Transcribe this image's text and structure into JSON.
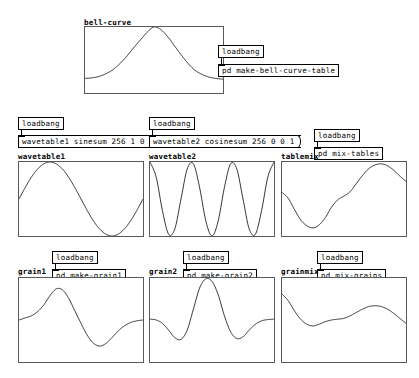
{
  "window": {
    "title": "pd patch",
    "background": "#ffffff",
    "foreground": "#000000",
    "array_border_color": "#555a5e"
  },
  "sections": [
    {
      "id": "bell-curve",
      "array_label": "bell-curve",
      "loadbang_label": "loadbang",
      "subpatch_label": "pd make-bell-curve-table"
    },
    {
      "id": "wavetable1",
      "array_label": "wavetable1",
      "loadbang_label": "loadbang",
      "message_label": "wavetable1 sinesum 256 1 0"
    },
    {
      "id": "wavetable2",
      "array_label": "wavetable2",
      "loadbang_label": "loadbang",
      "message_label": "wavetable2 cosinesum 256 0 0 1"
    },
    {
      "id": "tablemix",
      "array_label": "tablemix",
      "loadbang_label": "loadbang",
      "subpatch_label": "pd mix-tables"
    },
    {
      "id": "grain1",
      "array_label": "grain1",
      "loadbang_label": "loadbang",
      "subpatch_label": "pd make-grain1"
    },
    {
      "id": "grain2",
      "array_label": "grain2",
      "loadbang_label": "loadbang",
      "subpatch_label": "pd make-grain2"
    },
    {
      "id": "grainmix",
      "array_label": "grainmix",
      "loadbang_label": "loadbang",
      "subpatch_label": "pd mix-grains"
    }
  ],
  "chart_data": [
    {
      "id": "bell-curve",
      "type": "line",
      "title": "bell-curve",
      "xlabel": "",
      "ylabel": "",
      "xlim": [
        0,
        1
      ],
      "ylim": [
        0,
        1
      ],
      "grid": false,
      "description": "gaussian bell curve, baseline near 0.22, peak 1.0 centered",
      "x": [
        0.0,
        0.05,
        0.1,
        0.15,
        0.2,
        0.25,
        0.3,
        0.35,
        0.4,
        0.45,
        0.5,
        0.55,
        0.6,
        0.65,
        0.7,
        0.75,
        0.8,
        0.85,
        0.9,
        0.95,
        1.0
      ],
      "y": [
        0.22,
        0.23,
        0.25,
        0.29,
        0.35,
        0.44,
        0.55,
        0.68,
        0.8,
        0.92,
        1.0,
        0.96,
        0.85,
        0.71,
        0.57,
        0.44,
        0.34,
        0.28,
        0.24,
        0.22,
        0.21
      ]
    },
    {
      "id": "wavetable1",
      "type": "line",
      "title": "wavetable1",
      "xlabel": "",
      "ylabel": "",
      "xlim": [
        0,
        1
      ],
      "ylim": [
        -1,
        1
      ],
      "grid": false,
      "description": "one cycle sine, sinesum 256 1 0",
      "x": [
        0.0,
        0.05,
        0.1,
        0.15,
        0.2,
        0.25,
        0.3,
        0.35,
        0.4,
        0.45,
        0.5,
        0.55,
        0.6,
        0.65,
        0.7,
        0.75,
        0.8,
        0.85,
        0.9,
        0.95,
        1.0
      ],
      "y": [
        0.0,
        0.31,
        0.59,
        0.81,
        0.95,
        1.0,
        0.95,
        0.81,
        0.59,
        0.31,
        0.0,
        -0.31,
        -0.59,
        -0.81,
        -0.95,
        -1.0,
        -0.95,
        -0.81,
        -0.59,
        -0.31,
        0.0
      ]
    },
    {
      "id": "wavetable2",
      "type": "line",
      "title": "wavetable2",
      "xlabel": "",
      "ylabel": "",
      "xlim": [
        0,
        1
      ],
      "ylim": [
        -1,
        1
      ],
      "grid": false,
      "description": "third harmonic cosine, cosinesum 256 0 0 1",
      "x": [
        0.0,
        0.05,
        0.1,
        0.15,
        0.2,
        0.25,
        0.3,
        0.35,
        0.4,
        0.45,
        0.5,
        0.55,
        0.6,
        0.65,
        0.7,
        0.75,
        0.8,
        0.85,
        0.9,
        0.95,
        1.0
      ],
      "y": [
        1.0,
        0.59,
        -0.31,
        -0.95,
        -0.81,
        0.0,
        0.81,
        0.95,
        0.31,
        -0.59,
        -1.0,
        -0.59,
        0.31,
        0.95,
        0.81,
        0.0,
        -0.81,
        -0.95,
        -0.31,
        0.59,
        1.0
      ]
    },
    {
      "id": "tablemix",
      "type": "line",
      "title": "tablemix",
      "xlabel": "",
      "ylabel": "",
      "xlim": [
        0,
        1
      ],
      "ylim": [
        -1,
        1
      ],
      "grid": false,
      "description": "sum of wavetable1 and wavetable2 contents",
      "x": [
        0.0,
        0.05,
        0.1,
        0.15,
        0.2,
        0.25,
        0.3,
        0.35,
        0.4,
        0.45,
        0.5,
        0.55,
        0.6,
        0.65,
        0.7,
        0.75,
        0.8,
        0.85,
        0.9,
        0.95,
        1.0
      ],
      "y": [
        0.18,
        0.02,
        -0.28,
        -0.56,
        -0.72,
        -0.78,
        -0.7,
        -0.5,
        -0.22,
        -0.02,
        0.08,
        0.2,
        0.42,
        0.64,
        0.82,
        0.92,
        0.95,
        0.9,
        0.78,
        0.62,
        0.48
      ]
    },
    {
      "id": "grain1",
      "type": "line",
      "title": "grain1",
      "xlabel": "",
      "ylabel": "",
      "xlim": [
        0,
        1
      ],
      "ylim": [
        -1,
        1
      ],
      "grid": false,
      "description": "wavetable1 sine windowed by the bell curve",
      "x": [
        0.0,
        0.05,
        0.1,
        0.15,
        0.2,
        0.25,
        0.3,
        0.35,
        0.4,
        0.45,
        0.5,
        0.55,
        0.6,
        0.65,
        0.7,
        0.75,
        0.8,
        0.85,
        0.9,
        0.95,
        1.0
      ],
      "y": [
        0.0,
        0.05,
        0.1,
        0.2,
        0.36,
        0.58,
        0.74,
        0.72,
        0.52,
        0.22,
        -0.08,
        -0.36,
        -0.55,
        -0.62,
        -0.56,
        -0.42,
        -0.26,
        -0.14,
        -0.06,
        -0.02,
        0.0
      ]
    },
    {
      "id": "grain2",
      "type": "line",
      "title": "grain2",
      "xlabel": "",
      "ylabel": "",
      "xlim": [
        0,
        1
      ],
      "ylim": [
        -1,
        1
      ],
      "grid": false,
      "description": "wavetable2 cosine windowed by the bell curve",
      "x": [
        0.0,
        0.05,
        0.1,
        0.15,
        0.2,
        0.25,
        0.3,
        0.35,
        0.4,
        0.45,
        0.5,
        0.55,
        0.6,
        0.65,
        0.7,
        0.75,
        0.8,
        0.85,
        0.9,
        0.95,
        1.0
      ],
      "y": [
        0.02,
        0.0,
        -0.08,
        -0.24,
        -0.42,
        -0.46,
        -0.24,
        0.26,
        0.76,
        0.98,
        0.92,
        0.6,
        0.1,
        -0.28,
        -0.44,
        -0.4,
        -0.24,
        -0.1,
        -0.02,
        0.01,
        0.02
      ]
    },
    {
      "id": "grainmix",
      "type": "line",
      "title": "grainmix",
      "xlabel": "",
      "ylabel": "",
      "xlim": [
        0,
        1
      ],
      "ylim": [
        -1,
        1
      ],
      "grid": false,
      "description": "sum of grain1 and grain2 contents",
      "x": [
        0.0,
        0.05,
        0.1,
        0.15,
        0.2,
        0.25,
        0.3,
        0.35,
        0.4,
        0.45,
        0.5,
        0.55,
        0.6,
        0.65,
        0.7,
        0.75,
        0.8,
        0.85,
        0.9,
        0.95,
        1.0
      ],
      "y": [
        0.62,
        0.46,
        0.22,
        0.02,
        -0.1,
        -0.14,
        -0.1,
        -0.04,
        0.0,
        0.02,
        0.04,
        0.1,
        0.18,
        0.26,
        0.32,
        0.34,
        0.32,
        0.26,
        0.16,
        0.04,
        -0.08
      ]
    }
  ]
}
